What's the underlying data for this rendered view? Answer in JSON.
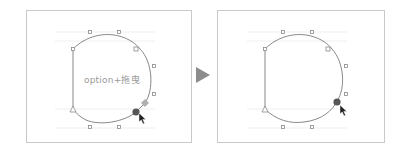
{
  "figure": {
    "before_panel": {
      "hint_text": "option+拖曳",
      "state": "dragging anchor with option key"
    },
    "after_panel": {
      "state": "anchor moved, handle detached"
    },
    "transition_arrow": "right-triangle-arrow"
  },
  "colors": {
    "frame_border": "#c9c9c9",
    "path_stroke": "#7a7a7a",
    "guide_line": "#e6e6e6",
    "handle_stroke": "#8a8a8a",
    "selected_anchor": "#555555",
    "hint_text": "#9a9a9a",
    "arrow": "#8c8c8c"
  }
}
